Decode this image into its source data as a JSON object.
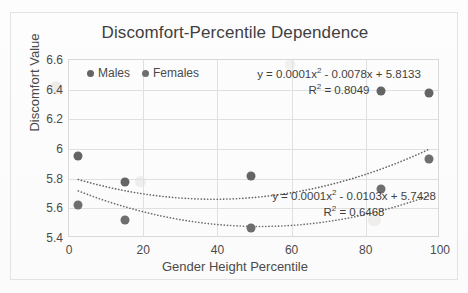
{
  "chart_data": {
    "type": "scatter",
    "title": "Discomfort-Percentile Dependence",
    "xlabel": "Gender Height Percentile",
    "ylabel": "Discomfort Value",
    "xlim": [
      0,
      100
    ],
    "ylim": [
      5.4,
      6.6
    ],
    "xticks": [
      "0",
      "20",
      "40",
      "60",
      "80",
      "100"
    ],
    "yticks": [
      "5.4",
      "5.6",
      "5.8",
      "6",
      "6.2",
      "6.4",
      "6.6"
    ],
    "grid": true,
    "legend_position": "top-left-inside",
    "series": [
      {
        "name": "Males",
        "color": "#646464",
        "x": [
          2.5,
          15,
          49,
          84,
          97
        ],
        "y": [
          5.95,
          5.78,
          5.82,
          6.39,
          6.38
        ],
        "trendline": {
          "type": "polynomial-2",
          "equation": "y = 0.0001x² - 0.0078x + 5.8133",
          "r2_label": "R² = 0.8049",
          "coefficients": [
            0.0001,
            -0.0078,
            5.8133
          ],
          "r2": 0.8049
        }
      },
      {
        "name": "Females",
        "color": "#6e6e6e",
        "x": [
          2.5,
          15,
          49,
          84,
          97
        ],
        "y": [
          5.62,
          5.52,
          5.47,
          5.73,
          5.93
        ],
        "trendline": {
          "type": "polynomial-2",
          "equation": "y = 0.0001x² - 0.0103x + 5.7428",
          "r2_label": "R² = 0.6468",
          "coefficients": [
            0.0001,
            -0.0103,
            5.7428
          ],
          "r2": 0.6468
        }
      }
    ]
  },
  "chart": {
    "title": "Discomfort-Percentile Dependence",
    "axis_x_title": "Gender Height Percentile",
    "axis_y_title": "Discomfort Value",
    "legend": [
      {
        "label": "Males"
      },
      {
        "label": "Females"
      }
    ],
    "annotations": {
      "males_equation_prefix": "y = 0.0001x",
      "males_equation_suffix": " - 0.0078x + 5.8133",
      "males_r2_prefix": "R",
      "males_r2_suffix": " = 0.8049",
      "females_equation_prefix": "y = 0.0001x",
      "females_equation_suffix": " - 0.0103x + 5.7428",
      "females_r2_prefix": "R",
      "females_r2_suffix": " = 0.6468",
      "superscript_two": "2"
    },
    "colors": {
      "males": "#646464",
      "females": "#6e6e6e",
      "grid": "#e0e0e0",
      "text": "#4a4a4a"
    }
  }
}
